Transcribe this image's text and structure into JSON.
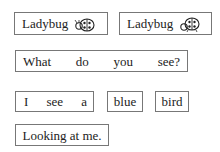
{
  "cards": [
    {
      "label": "Ladybug",
      "icon": "ladybug-icon"
    },
    {
      "label": "Ladybug",
      "icon": "ladybug-icon"
    }
  ],
  "sentence1": {
    "words": [
      "What",
      "do",
      "you",
      "see?"
    ]
  },
  "sentence2": {
    "words": [
      "I",
      "see",
      "a"
    ],
    "word_blue": "blue",
    "word_bird": "bird"
  },
  "sentence3": {
    "text": "Looking at me."
  }
}
